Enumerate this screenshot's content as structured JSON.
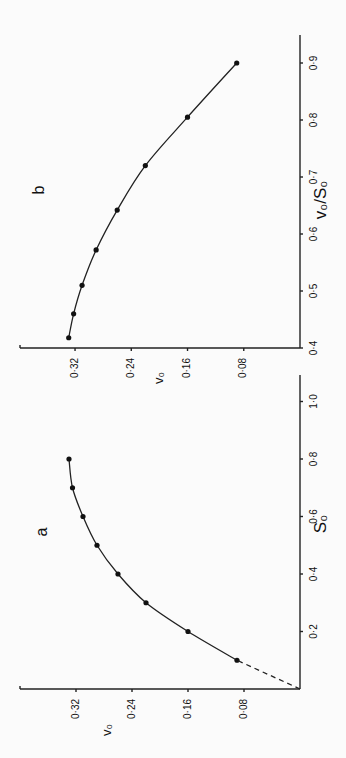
{
  "chart_data": [
    {
      "panel": "a",
      "type": "line",
      "orientation": "rotated 90° counter-clockwise",
      "title": "a",
      "xlabel": "S₀",
      "ylabel": "v₀",
      "xlim": [
        0,
        1.1
      ],
      "ylim": [
        0,
        0.38
      ],
      "xticks": [
        0.2,
        0.4,
        0.6,
        0.8,
        1.0
      ],
      "xtick_labels": [
        "0·2",
        "0·4",
        "0·6",
        "0·8",
        "1·0"
      ],
      "yticks": [
        0.08,
        0.16,
        0.24,
        0.32
      ],
      "ytick_labels": [
        "0·08",
        "0·16",
        "0·24",
        "0·32"
      ],
      "grid": false,
      "series": [
        {
          "name": "v0 vs S0",
          "x": [
            0.1,
            0.2,
            0.3,
            0.4,
            0.5,
            0.6,
            0.7,
            0.8
          ],
          "y": [
            0.09,
            0.16,
            0.22,
            0.26,
            0.29,
            0.31,
            0.325,
            0.33
          ],
          "marker": "filled-circle",
          "line": "solid-smooth"
        },
        {
          "name": "extrapolation",
          "x": [
            0.0,
            0.1
          ],
          "y": [
            0.0,
            0.09
          ],
          "marker": "none",
          "line": "dashed"
        }
      ]
    },
    {
      "panel": "b",
      "type": "line",
      "orientation": "rotated 90° counter-clockwise",
      "title": "b",
      "xlabel": "v₀/S₀",
      "ylabel": "v₀",
      "xlim": [
        0.4,
        0.95
      ],
      "ylim": [
        0,
        0.38
      ],
      "xticks": [
        0.4,
        0.5,
        0.6,
        0.7,
        0.8,
        0.9
      ],
      "xtick_labels": [
        "0·4",
        "0·5",
        "0·6",
        "0·7",
        "0·8",
        "0·9"
      ],
      "yticks": [
        0.08,
        0.16,
        0.24,
        0.32
      ],
      "ytick_labels": [
        "0·08",
        "0·16",
        "0·24",
        "0·32"
      ],
      "grid": false,
      "series": [
        {
          "name": "v0 vs v0/S0",
          "x": [
            0.9,
            0.805,
            0.72,
            0.642,
            0.572,
            0.51,
            0.46,
            0.418
          ],
          "y": [
            0.09,
            0.16,
            0.22,
            0.26,
            0.29,
            0.31,
            0.322,
            0.329
          ],
          "marker": "filled-circle",
          "line": "solid-smooth"
        }
      ]
    }
  ]
}
